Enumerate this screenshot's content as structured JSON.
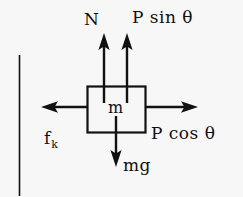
{
  "diagram": {
    "colors": {
      "background": "#f7f7f7",
      "ink": "#111111"
    },
    "body": {
      "label": "m",
      "shape": "rectangle"
    },
    "wall": {
      "label": "",
      "orientation": "vertical"
    },
    "forces": [
      {
        "key": "normal",
        "label": "N",
        "direction": "up",
        "name": "normal-force"
      },
      {
        "key": "p_sin_theta",
        "label": "P sin θ",
        "direction": "up",
        "name": "applied-force-vertical-component"
      },
      {
        "key": "friction",
        "label_main": "f",
        "label_sub": "k",
        "direction": "left",
        "name": "kinetic-friction-force"
      },
      {
        "key": "p_cos_theta",
        "label": "P cos θ",
        "direction": "right",
        "name": "applied-force-horizontal-component"
      },
      {
        "key": "weight",
        "label": "mg",
        "direction": "down",
        "name": "weight-force"
      }
    ]
  }
}
